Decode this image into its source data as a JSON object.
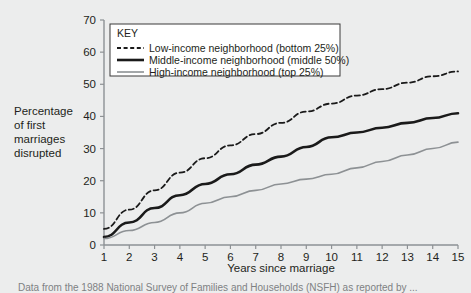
{
  "chart_data": {
    "type": "line",
    "title": "",
    "xlabel": "Years since marriage",
    "ylabel": "Percentage of first marriages disrupted",
    "ylabel_lines": [
      "Percentage",
      "of first",
      "marriages",
      "disrupted"
    ],
    "xlim": [
      1,
      15
    ],
    "ylim": [
      0,
      70
    ],
    "xticks": [
      1,
      2,
      3,
      4,
      5,
      6,
      7,
      8,
      9,
      10,
      11,
      12,
      13,
      14,
      15
    ],
    "yticks": [
      0,
      10,
      20,
      30,
      40,
      50,
      60,
      70
    ],
    "grid": false,
    "legend_position": "upper left inside plot",
    "legend_title": "KEY",
    "x": [
      1,
      2,
      3,
      4,
      5,
      6,
      7,
      8,
      9,
      10,
      11,
      12,
      13,
      14,
      15
    ],
    "series": [
      {
        "name": "Low-income neighborhood (bottom 25%)",
        "style": "dashed",
        "color": "#1a1a1a",
        "width": 1.8,
        "values": [
          5,
          11,
          17,
          22.5,
          27,
          31,
          34.5,
          38,
          41.5,
          44,
          46.5,
          48.5,
          50.5,
          52.5,
          54
        ]
      },
      {
        "name": "Middle-income neighborhood (middle 50%)",
        "style": "solid",
        "color": "#1a1a1a",
        "width": 2.6,
        "values": [
          2.5,
          7,
          11.5,
          15.5,
          19,
          22,
          25,
          27.5,
          30.5,
          33.5,
          35,
          36.5,
          38,
          39.5,
          41
        ]
      },
      {
        "name": "High-income neighborhood (top 25%)",
        "style": "solid",
        "color": "#8d9194",
        "width": 1.6,
        "values": [
          2,
          4.5,
          7,
          10,
          13,
          15,
          17,
          19,
          20.5,
          22,
          24,
          26,
          28,
          30,
          32
        ]
      }
    ]
  },
  "axes": {
    "x_axis_name": "x-axis",
    "y_axis_name": "y-axis"
  },
  "caption": {
    "text": "Data from the 1988 National Survey of Families and Households (NSFH) as reported by ..."
  }
}
